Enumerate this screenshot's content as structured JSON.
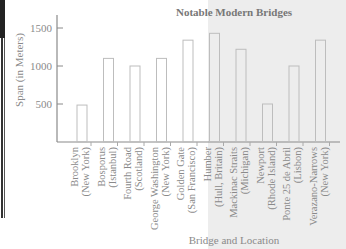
{
  "chart_data": {
    "type": "bar",
    "title": "Notable Modern Bridges",
    "xlabel": "Bridge and Location",
    "ylabel": "Span (in Meters)",
    "ylim": [
      0,
      1650
    ],
    "yticks": [
      500,
      1000,
      1500
    ],
    "grid": false,
    "categories": [
      [
        "Brooklyn",
        "(New York)"
      ],
      [
        "Bosporus",
        "(Istanbul)"
      ],
      [
        "Fourth Road",
        "(Scotland)"
      ],
      [
        "George Washington",
        "(New York)"
      ],
      [
        "Golden Gate",
        "(San Francisco)"
      ],
      [
        "Humber",
        "(Hull, Britain)"
      ],
      [
        "Mackinac Straits",
        "(Michigan)"
      ],
      [
        "Newport",
        "(Rhode Island)"
      ],
      [
        "Ponte 25 de Abril",
        "(Lisbon)"
      ],
      [
        "Verazano-Narrows",
        "(New York)"
      ]
    ],
    "values": [
      486,
      1100,
      1000,
      1100,
      1340,
      1430,
      1220,
      500,
      1000,
      1340
    ]
  }
}
